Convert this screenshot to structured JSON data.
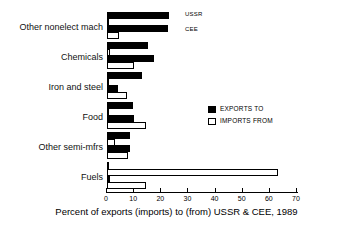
{
  "chart_data": {
    "type": "bar",
    "orientation": "horizontal",
    "title": "",
    "xlabel": "Percent of exports (imports) to (from) USSR & CEE, 1989",
    "ylabel": "",
    "xlim": [
      0,
      70
    ],
    "xticks": [
      0,
      10,
      20,
      30,
      40,
      50,
      60,
      70
    ],
    "xtick_labels": [
      "0",
      "10",
      "20",
      "30",
      "40",
      "50",
      "60",
      "70"
    ],
    "grid": false,
    "categories": [
      "Other nonelect mach",
      "Chemicals",
      "Iron and steel",
      "Food",
      "Other semi-mfrs",
      "Fuels"
    ],
    "series": [
      {
        "name": "USSR exports to",
        "partner": "USSR",
        "flow": "EXPORTS TO",
        "style": "filled",
        "values": [
          23.0,
          15.2,
          12.8,
          9.4,
          8.4,
          0.5
        ]
      },
      {
        "name": "USSR imports from",
        "partner": "USSR",
        "flow": "IMPORTS FROM",
        "style": "open",
        "values": [
          0.4,
          1.0,
          0.6,
          0.8,
          2.8,
          63.0
        ]
      },
      {
        "name": "CEE exports to",
        "partner": "CEE",
        "flow": "EXPORTS TO",
        "style": "filled",
        "values": [
          22.3,
          17.4,
          4.0,
          10.0,
          8.4,
          1.0
        ]
      },
      {
        "name": "CEE imports from",
        "partner": "CEE",
        "flow": "IMPORTS FROM",
        "style": "open",
        "values": [
          4.6,
          9.9,
          7.5,
          14.5,
          7.8,
          14.5
        ]
      }
    ],
    "annotations": [
      {
        "text": "USSR",
        "note": "marks the upper pair of bars in the top group"
      },
      {
        "text": "CEE",
        "note": "marks the lower pair of bars in the top group"
      }
    ],
    "legend": {
      "position": "center-right",
      "entries": [
        {
          "label": "EXPORTS TO",
          "style": "filled"
        },
        {
          "label": "IMPORTS FROM",
          "style": "open"
        }
      ]
    }
  }
}
